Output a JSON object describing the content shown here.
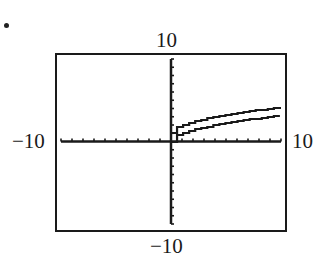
{
  "figure": {
    "bullet": "•",
    "window": {
      "xmin_label": "−10",
      "xmax_label": "10",
      "ymax_label": "10",
      "ymin_label": "−10"
    }
  },
  "chart_data": {
    "type": "line",
    "title": "",
    "xlabel": "",
    "ylabel": "",
    "xlim": [
      -10,
      10
    ],
    "ylim": [
      -10,
      10
    ],
    "xscale_tick": 1,
    "yscale_tick": 1,
    "grid": false,
    "legend": "none",
    "series": [
      {
        "name": "upper curve (≈ y = √x + 1)",
        "x": [
          0,
          1,
          2,
          3,
          4,
          5,
          6,
          7,
          8,
          9,
          10
        ],
        "values": [
          1.0,
          2.0,
          2.41,
          2.73,
          3.0,
          3.24,
          3.45,
          3.65,
          3.83,
          4.0,
          4.16
        ]
      },
      {
        "name": "lower curve (≈ y = √x)",
        "x": [
          0,
          1,
          2,
          3,
          4,
          5,
          6,
          7,
          8,
          9,
          10
        ],
        "values": [
          0.0,
          1.0,
          1.41,
          1.73,
          2.0,
          2.24,
          2.45,
          2.65,
          2.83,
          3.0,
          3.16
        ]
      }
    ],
    "annotations": [
      "10 (ymax, above frame)",
      "−10 (ymin, below frame)",
      "−10 (xmin, left of frame)",
      "10 (xmax, right of frame)"
    ]
  }
}
